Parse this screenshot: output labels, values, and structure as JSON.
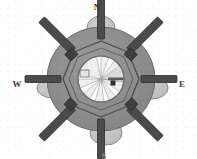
{
  "figure": {
    "background_color": "#ffffff",
    "width": 197,
    "height": 159
  },
  "compass": {
    "north": {
      "label": "N",
      "name": "north"
    },
    "west": {
      "label": "W",
      "name": "west"
    },
    "east": {
      "label": "E",
      "name": "east"
    },
    "south": {
      "label": "S",
      "name": "south",
      "clipped": true
    }
  },
  "colors": {
    "enclosure_fill": "#8e8e8e",
    "enclosure_stroke": "#6f6f6f",
    "lobe_fill": "#c3c3c3",
    "lobe_stroke": "#8a8a8a",
    "hub_fill": "#efefef",
    "hub_stroke": "#7a7a7a",
    "spoke_fill": "#4b4b4b",
    "spoke_stroke": "#2e2e2e",
    "polygon_stroke": "#454545",
    "ray_fill": "#ffffff",
    "ray_stroke": "#9a9a9a",
    "marker_fill": "#303030",
    "label_color": "#3a3a3a"
  },
  "geometry": {
    "center": {
      "x": 101,
      "y": 79
    },
    "enclosure_radius_x": 54,
    "enclosure_radius_y": 52,
    "hub_radius": 23,
    "polygon_radius": 38,
    "polygon_sides": 8,
    "spoke_count": 8,
    "ray_count": 9
  },
  "lobes": [
    {
      "name": "lobe-north",
      "cx": 101,
      "cy": 28,
      "rx": 14,
      "ry": 12
    },
    {
      "name": "lobe-east",
      "cx": 152,
      "cy": 88,
      "rx": 16,
      "ry": 11
    },
    {
      "name": "lobe-south",
      "cx": 106,
      "cy": 133,
      "rx": 16,
      "ry": 12
    },
    {
      "name": "lobe-west",
      "cx": 53,
      "cy": 88,
      "rx": 16,
      "ry": 10
    }
  ],
  "spokes": [
    {
      "name": "spoke-n",
      "angle": -90,
      "length": 40,
      "width": 7
    },
    {
      "name": "spoke-ne",
      "angle": -45,
      "length": 44,
      "width": 8
    },
    {
      "name": "spoke-e",
      "angle": 0,
      "length": 36,
      "width": 7
    },
    {
      "name": "spoke-se",
      "angle": 45,
      "length": 44,
      "width": 8
    },
    {
      "name": "spoke-s",
      "angle": 90,
      "length": 40,
      "width": 7
    },
    {
      "name": "spoke-sw",
      "angle": 135,
      "length": 44,
      "width": 8
    },
    {
      "name": "spoke-w",
      "angle": 180,
      "length": 36,
      "width": 7
    },
    {
      "name": "spoke-nw",
      "angle": 225,
      "length": 44,
      "width": 8
    }
  ],
  "rays": [
    {
      "name": "ray-1",
      "angle": -96,
      "width_deg": 7
    },
    {
      "name": "ray-2",
      "angle": -62,
      "width_deg": 8
    },
    {
      "name": "ray-3",
      "angle": -28,
      "width_deg": 6
    },
    {
      "name": "ray-4",
      "angle": 6,
      "width_deg": 7
    },
    {
      "name": "ray-5",
      "angle": 42,
      "width_deg": 8
    },
    {
      "name": "ray-6",
      "angle": 76,
      "width_deg": 6
    },
    {
      "name": "ray-7",
      "angle": 112,
      "width_deg": 8
    },
    {
      "name": "ray-8",
      "angle": 148,
      "width_deg": 7
    },
    {
      "name": "ray-9",
      "angle": 186,
      "width_deg": 6
    }
  ],
  "marker": {
    "name": "center-marker",
    "x": 113,
    "y": 83,
    "size": 5
  }
}
